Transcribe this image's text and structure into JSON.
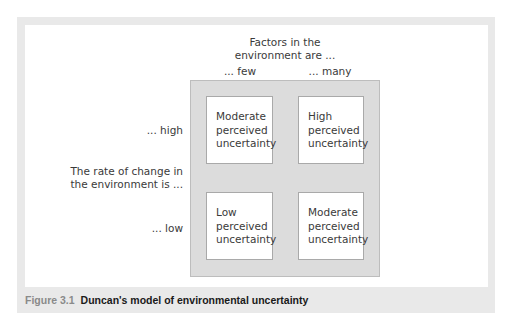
{
  "diagram": {
    "top_header": {
      "line1": "Factors in the",
      "line2": "environment are ..."
    },
    "columns": [
      {
        "label": "... few"
      },
      {
        "label": "... many"
      }
    ],
    "rows": [
      {
        "label": "... high"
      },
      {
        "label": "... low"
      }
    ],
    "side_header": {
      "line1": "The rate of change in",
      "line2": "the environment is ..."
    },
    "cells": [
      {
        "line1": "Moderate",
        "line2": "perceived",
        "line3": "uncertainty"
      },
      {
        "line1": "High",
        "line2": "perceived",
        "line3": "uncertainty"
      },
      {
        "line1": "Low",
        "line2": "perceived",
        "line3": "uncertainty"
      },
      {
        "line1": "Moderate",
        "line2": "perceived",
        "line3": "uncertainty"
      }
    ],
    "colors": {
      "frame": "#e9e9e9",
      "grid_background": "#dcdcdc",
      "cell_background": "#ffffff"
    }
  },
  "caption": {
    "label": "Figure 3.1",
    "title": "Duncan's model of environmental uncertainty"
  }
}
